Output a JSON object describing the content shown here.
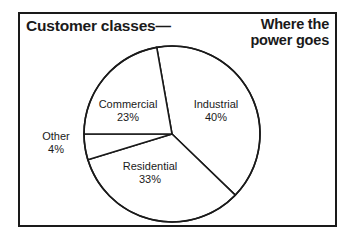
{
  "figure": {
    "title_left": "Customer classes—",
    "title_right_line1": "Where the",
    "title_right_line2": "power goes",
    "frame_color": "#1a1a1a",
    "background_color": "#ffffff"
  },
  "chart_data": {
    "type": "pie",
    "title": "Customer classes—",
    "subtitle": "Where the power goes",
    "unit": "%",
    "categories": [
      "Industrial",
      "Residential",
      "Other",
      "Commercial"
    ],
    "values": [
      40,
      33,
      4,
      23
    ],
    "total": 100,
    "legend": "none",
    "grid": false,
    "slice_fill": "#ffffff",
    "slice_stroke": "#1a1a1a",
    "slices": [
      {
        "name": "Industrial",
        "value": 40,
        "label": "Industrial",
        "value_label": "40%",
        "start_angle_deg": -100,
        "end_angle_deg": 44,
        "label_position": "inside"
      },
      {
        "name": "Residential",
        "value": 33,
        "label": "Residential",
        "value_label": "33%",
        "start_angle_deg": 44,
        "end_angle_deg": 163,
        "label_position": "inside"
      },
      {
        "name": "Other",
        "value": 4,
        "label": "Other",
        "value_label": "4%",
        "start_angle_deg": 163,
        "end_angle_deg": 180,
        "label_position": "outside-left"
      },
      {
        "name": "Commercial",
        "value": 23,
        "label": "Commercial",
        "value_label": "23%",
        "start_angle_deg": 180,
        "end_angle_deg": 260,
        "label_position": "inside"
      }
    ],
    "geometry": {
      "center_x": 172,
      "center_y": 134,
      "radius": 88
    }
  }
}
